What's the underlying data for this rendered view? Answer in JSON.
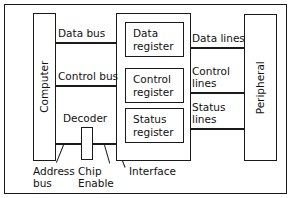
{
  "diagram": {
    "colors": {
      "stroke": "#1a1a1a",
      "background": "#ffffff",
      "text": "#111111"
    },
    "blocks": {
      "computer": "Computer",
      "peripheral": "Peripheral",
      "decoder": "Decoder",
      "data_register_line1": "Data",
      "data_register_line2": "register",
      "control_register_line1": "Control",
      "control_register_line2": "register",
      "status_register_line1": "Status",
      "status_register_line2": "register"
    },
    "bus_labels": {
      "data_bus": "Data bus",
      "control_bus": "Control bus",
      "address_bus_line1": "Address",
      "address_bus_line2": "bus",
      "chip_enable_line1": "Chip",
      "chip_enable_line2": "Enable",
      "interface": "Interface"
    },
    "line_labels": {
      "data_lines": "Data lines",
      "control_lines_line1": "Control",
      "control_lines_line2": "lines",
      "status_lines_line1": "Status",
      "status_lines_line2": "lines"
    }
  }
}
